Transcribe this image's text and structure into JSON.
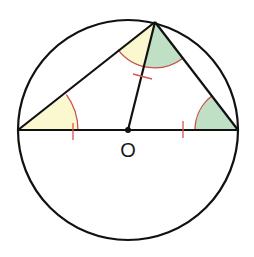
{
  "diagram": {
    "title": "",
    "type": "geometry",
    "circle": {
      "cx": 128,
      "cy": 130,
      "r": 110,
      "stroke": "#111111"
    },
    "points": {
      "A": {
        "x": 18,
        "y": 130
      },
      "B": {
        "x": 238,
        "y": 130
      },
      "C": {
        "x": 155,
        "y": 22
      },
      "O": {
        "x": 128,
        "y": 130
      }
    },
    "labels": [
      {
        "id": "center-label",
        "text": "O",
        "x": 128,
        "y": 157
      }
    ],
    "segments": [
      "A-B (diameter)",
      "A-C",
      "C-B",
      "O-C (radius)"
    ],
    "angle_marks": [
      {
        "vertex": "A",
        "between": [
          "B",
          "C"
        ],
        "fill": "#fbf7cf",
        "meaning": "equal to angle OCA"
      },
      {
        "vertex": "C",
        "between": [
          "A",
          "O"
        ],
        "fill": "#fbf7cf",
        "meaning": "equal to angle at A"
      },
      {
        "vertex": "C",
        "between": [
          "O",
          "B"
        ],
        "fill": "#bfe0c4",
        "meaning": "equal to angle at B"
      },
      {
        "vertex": "B",
        "between": [
          "A",
          "C"
        ],
        "fill": "#bfe0c4",
        "meaning": "equal to angle OCB"
      }
    ],
    "tick_marks": [
      {
        "segment": "O-A",
        "count": 1,
        "meaning": "OA = radius"
      },
      {
        "segment": "O-B",
        "count": 1,
        "meaning": "OB = radius"
      },
      {
        "segment": "O-C",
        "count": 1,
        "meaning": "OC = radius"
      }
    ],
    "colors": {
      "line": "#111111",
      "arc": "#c8504a",
      "yellow_fill": "#fbf7cf",
      "green_fill": "#bfe0c4",
      "tick": "#d9534f"
    }
  }
}
